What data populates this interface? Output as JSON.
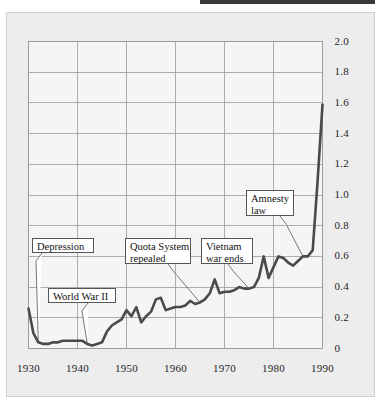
{
  "figure": {
    "top_rule": "horizontal-rule-fragment",
    "background_color": "#ededed",
    "frame_border_color": "#cfcfcf",
    "plot_background_color": "#f5f5f5",
    "grid_color": "#9a9a9a",
    "line_color": "#4a4a4a",
    "callout_border_color": "#555555",
    "text_color": "#1d1d1d"
  },
  "chart_data": {
    "type": "line",
    "title": "",
    "subtitle": "",
    "xlabel": "",
    "ylabel": "",
    "xlim": [
      1930,
      1990
    ],
    "ylim": [
      0,
      2.0
    ],
    "grid": true,
    "legend": "none",
    "y_axis_position": "right",
    "x_ticks": [
      1930,
      1940,
      1950,
      1960,
      1970,
      1980,
      1990
    ],
    "x_tick_labels": [
      "1930",
      "1940",
      "1950",
      "1960",
      "1970",
      "1980",
      "1990"
    ],
    "y_ticks": [
      0,
      0.2,
      0.4,
      0.6,
      0.8,
      1.0,
      1.2,
      1.4,
      1.6,
      1.8,
      2.0
    ],
    "y_tick_labels": [
      "0",
      "0.2",
      "0.4",
      "0.6",
      "0.8",
      "1.0",
      "1.2",
      "1.4",
      "1.6",
      "1.8",
      "2.0"
    ],
    "series": [
      {
        "name": "immigration",
        "x": [
          1930,
          1931,
          1932,
          1933,
          1934,
          1935,
          1936,
          1937,
          1938,
          1939,
          1940,
          1941,
          1942,
          1943,
          1944,
          1945,
          1946,
          1947,
          1948,
          1949,
          1950,
          1951,
          1952,
          1953,
          1954,
          1955,
          1956,
          1957,
          1958,
          1959,
          1960,
          1961,
          1962,
          1963,
          1964,
          1965,
          1966,
          1967,
          1968,
          1969,
          1970,
          1971,
          1972,
          1973,
          1974,
          1975,
          1976,
          1977,
          1978,
          1979,
          1980,
          1981,
          1982,
          1983,
          1984,
          1985,
          1986,
          1987,
          1988,
          1989,
          1990
        ],
        "values": [
          0.26,
          0.1,
          0.04,
          0.03,
          0.03,
          0.04,
          0.04,
          0.05,
          0.05,
          0.05,
          0.05,
          0.05,
          0.03,
          0.02,
          0.03,
          0.04,
          0.11,
          0.15,
          0.17,
          0.19,
          0.25,
          0.21,
          0.27,
          0.17,
          0.21,
          0.24,
          0.32,
          0.33,
          0.25,
          0.26,
          0.27,
          0.27,
          0.28,
          0.31,
          0.29,
          0.3,
          0.32,
          0.36,
          0.45,
          0.36,
          0.37,
          0.37,
          0.38,
          0.4,
          0.39,
          0.39,
          0.4,
          0.46,
          0.6,
          0.46,
          0.53,
          0.6,
          0.59,
          0.56,
          0.54,
          0.57,
          0.6,
          0.6,
          0.64,
          1.09,
          1.59
        ]
      }
    ],
    "annotations": [
      {
        "label": "Depression",
        "lines": [
          "Depression"
        ],
        "target_year": 1932,
        "target_value": 0.04
      },
      {
        "label": "World War II",
        "lines": [
          "World War II"
        ],
        "target_year": 1942,
        "target_value": 0.03
      },
      {
        "label": "Quota System repealed",
        "lines": [
          "Quota System",
          "repealed"
        ],
        "target_year": 1965,
        "target_value": 0.3
      },
      {
        "label": "Vietnam war ends",
        "lines": [
          "Vietnam",
          "war ends"
        ],
        "target_year": 1975,
        "target_value": 0.39
      },
      {
        "label": "Amnesty law",
        "lines": [
          "Amnesty",
          "law"
        ],
        "target_year": 1986,
        "target_value": 0.6
      }
    ]
  }
}
